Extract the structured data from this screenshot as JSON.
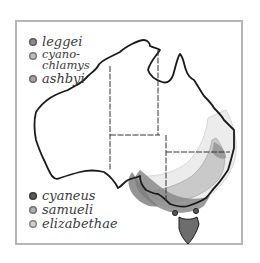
{
  "map": {
    "region": "Australia",
    "frame_color": "#b5b5b5",
    "coast_color": "#1a1a1a",
    "border_color": "#333333"
  },
  "legend_top": [
    {
      "label": "leggei",
      "color": "#8c8c8c",
      "icon": "range-dot-icon"
    },
    {
      "label": "cyano-\nchlamys",
      "color": "#bdbdbd",
      "icon": "range-dot-icon"
    },
    {
      "label": "ashbyi",
      "color": "#a5a5a5",
      "icon": "range-dot-icon"
    }
  ],
  "legend_bottom": [
    {
      "label": "cyaneus",
      "color": "#5a5a5a",
      "icon": "range-dot-icon"
    },
    {
      "label": "samueli",
      "color": "#b0b0b0",
      "icon": "range-dot-icon"
    },
    {
      "label": "elizabethae",
      "color": "#cfcfcf",
      "icon": "range-dot-icon"
    }
  ],
  "ranges": {
    "cyaneus": "#6a6a6a",
    "samueli_outer": "#e6e6e6",
    "samueli_inner": "#d4d4d4",
    "elizabethae": "#5e5e5e",
    "band": "#9a9a9a"
  }
}
